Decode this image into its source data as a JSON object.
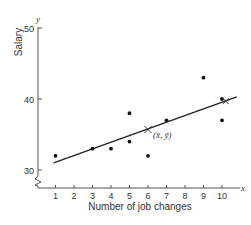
{
  "chart_data": {
    "type": "scatter",
    "title": "",
    "xlabel": "Number of job changes",
    "ylabel": "Salary",
    "x_axis_letter": "x",
    "y_axis_letter": "y",
    "xlim": [
      0,
      11
    ],
    "ylim": [
      30,
      50
    ],
    "y_axis_break": true,
    "grid": false,
    "x_ticks": [
      1,
      2,
      3,
      4,
      5,
      6,
      7,
      8,
      9,
      10
    ],
    "y_ticks": [
      30,
      40,
      50
    ],
    "series": [
      {
        "name": "observations",
        "points": [
          {
            "x": 1,
            "y": 32
          },
          {
            "x": 3,
            "y": 33
          },
          {
            "x": 4,
            "y": 33
          },
          {
            "x": 5,
            "y": 38
          },
          {
            "x": 5,
            "y": 34
          },
          {
            "x": 6,
            "y": 32
          },
          {
            "x": 7,
            "y": 37
          },
          {
            "x": 9,
            "y": 43
          },
          {
            "x": 10,
            "y": 40
          },
          {
            "x": 10,
            "y": 37
          }
        ]
      }
    ],
    "regression_line": {
      "x": [
        0.9,
        10.8
      ],
      "y": [
        31.0,
        40.3
      ]
    },
    "mean_point": {
      "x": 6,
      "y": 35.7,
      "label": "(x̄, ȳ)"
    },
    "annotations": [
      "(x̄, ȳ)"
    ]
  },
  "colors": {
    "ink": "#222222",
    "axis": "#555555"
  }
}
